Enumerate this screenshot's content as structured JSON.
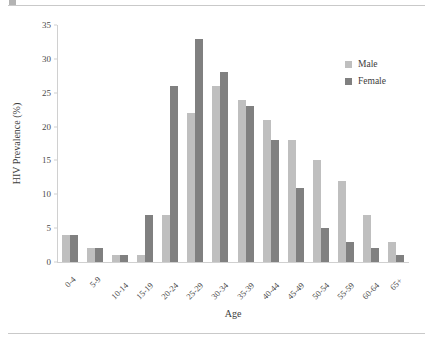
{
  "chart_data": {
    "type": "bar",
    "title": "",
    "xlabel": "Age",
    "ylabel": "HIV Prevalence (%)",
    "ylim": [
      0,
      35
    ],
    "yticks": [
      0,
      5,
      10,
      15,
      20,
      25,
      30,
      35
    ],
    "grid": false,
    "legend_position": "top-right",
    "categories": [
      "0-4",
      "5-9",
      "10-14",
      "15-19",
      "20-24",
      "25-29",
      "30-34",
      "35-39",
      "40-44",
      "45-49",
      "50-54",
      "55-59",
      "60-64",
      "65+"
    ],
    "series": [
      {
        "name": "Male",
        "color": "#bfbfbf",
        "values": [
          4,
          2,
          1,
          1,
          7,
          22,
          26,
          24,
          21,
          18,
          15,
          12,
          7,
          3
        ]
      },
      {
        "name": "Female",
        "color": "#808080",
        "values": [
          4,
          2,
          1,
          7,
          26,
          33,
          28,
          23,
          18,
          11,
          5,
          3,
          2,
          1
        ]
      }
    ]
  },
  "legend": {
    "items": [
      {
        "label": "Male",
        "swatch": "male"
      },
      {
        "label": "Female",
        "swatch": "female"
      }
    ]
  },
  "axes": {
    "y_title": "HIV Prevalence (%)",
    "x_title": "Age"
  }
}
